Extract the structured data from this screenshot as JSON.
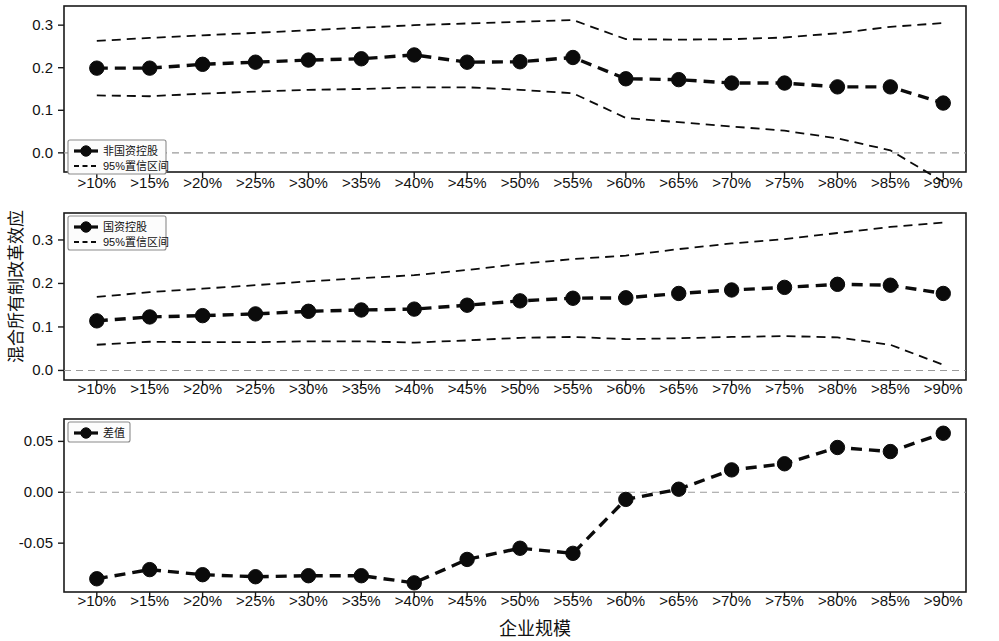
{
  "figure": {
    "ylabel": "混合所有制改革效应",
    "xlabel": "企业规模"
  },
  "chart_data": [
    {
      "type": "line",
      "panel_index": 1,
      "title": "",
      "xlabel": "",
      "ylabel": "混合所有制改革效应",
      "categories": [
        ">10%",
        ">15%",
        ">20%",
        ">25%",
        ">30%",
        ">35%",
        ">40%",
        ">45%",
        ">50%",
        ">55%",
        ">60%",
        ">65%",
        ">70%",
        ">75%",
        ">80%",
        ">85%",
        ">90%"
      ],
      "ytick_labels": [
        "0.0",
        "0.1",
        "0.2",
        "0.3"
      ],
      "ytick_values": [
        0.0,
        0.1,
        0.2,
        0.3
      ],
      "ylim": [
        -0.045,
        0.345
      ],
      "grid": false,
      "zero_reference_line": 0.0,
      "legend_position": "lower-left",
      "series": [
        {
          "name": "非国资控股",
          "style": "dashed-with-markers",
          "values": [
            0.199,
            0.199,
            0.208,
            0.213,
            0.218,
            0.221,
            0.23,
            0.213,
            0.214,
            0.224,
            0.174,
            0.172,
            0.164,
            0.164,
            0.155,
            0.155,
            0.117
          ]
        },
        {
          "name": "95%置信区间",
          "style": "dashed-upper",
          "values": [
            0.263,
            0.27,
            0.276,
            0.282,
            0.288,
            0.294,
            0.3,
            0.304,
            0.308,
            0.312,
            0.267,
            0.266,
            0.267,
            0.271,
            0.281,
            0.296,
            0.305
          ]
        },
        {
          "name": "95%置信区间",
          "style": "dashed-lower",
          "values": [
            0.135,
            0.133,
            0.139,
            0.144,
            0.148,
            0.15,
            0.154,
            0.154,
            0.148,
            0.14,
            0.082,
            0.072,
            0.062,
            0.052,
            0.034,
            0.006,
            -0.068
          ]
        }
      ]
    },
    {
      "type": "line",
      "panel_index": 2,
      "title": "",
      "xlabel": "",
      "ylabel": "混合所有制改革效应",
      "categories": [
        ">10%",
        ">15%",
        ">20%",
        ">25%",
        ">30%",
        ">35%",
        ">40%",
        ">45%",
        ">50%",
        ">55%",
        ">60%",
        ">65%",
        ">70%",
        ">75%",
        ">80%",
        ">85%",
        ">90%"
      ],
      "ytick_labels": [
        "0.0",
        "0.1",
        "0.2",
        "0.3"
      ],
      "ytick_values": [
        0.0,
        0.1,
        0.2,
        0.3
      ],
      "ylim": [
        -0.022,
        0.362
      ],
      "grid": false,
      "zero_reference_line": 0.0,
      "legend_position": "upper-left",
      "series": [
        {
          "name": "国资控股",
          "style": "dashed-with-markers",
          "values": [
            0.114,
            0.123,
            0.126,
            0.13,
            0.136,
            0.139,
            0.141,
            0.15,
            0.16,
            0.166,
            0.167,
            0.177,
            0.185,
            0.191,
            0.198,
            0.196,
            0.177
          ]
        },
        {
          "name": "95%置信区间",
          "style": "dashed-upper",
          "values": [
            0.169,
            0.18,
            0.188,
            0.196,
            0.205,
            0.212,
            0.219,
            0.231,
            0.245,
            0.256,
            0.264,
            0.279,
            0.292,
            0.302,
            0.316,
            0.33,
            0.34
          ]
        },
        {
          "name": "95%置信区间",
          "style": "dashed-lower",
          "values": [
            0.059,
            0.066,
            0.065,
            0.065,
            0.067,
            0.067,
            0.064,
            0.069,
            0.075,
            0.077,
            0.072,
            0.074,
            0.077,
            0.079,
            0.076,
            0.059,
            0.013
          ]
        }
      ]
    },
    {
      "type": "line",
      "panel_index": 3,
      "title": "",
      "xlabel": "企业规模",
      "ylabel": "混合所有制改革效应",
      "categories": [
        ">10%",
        ">15%",
        ">20%",
        ">25%",
        ">30%",
        ">35%",
        ">40%",
        ">45%",
        ">50%",
        ">55%",
        ">60%",
        ">65%",
        ">70%",
        ">75%",
        ">80%",
        ">85%",
        ">90%"
      ],
      "ytick_labels": [
        "0.05",
        "0.00",
        "-0.05"
      ],
      "ytick_values": [
        0.05,
        0.0,
        -0.05
      ],
      "ylim": [
        -0.098,
        0.072
      ],
      "grid": false,
      "zero_reference_line": 0.0,
      "legend_position": "upper-left",
      "series": [
        {
          "name": "差值",
          "style": "dashed-with-markers",
          "values": [
            -0.085,
            -0.076,
            -0.081,
            -0.083,
            -0.082,
            -0.082,
            -0.089,
            -0.066,
            -0.055,
            -0.06,
            -0.007,
            0.003,
            0.022,
            0.028,
            0.044,
            0.04,
            0.058
          ]
        }
      ]
    }
  ],
  "panels": [
    {
      "legend": {
        "entries": [
          {
            "label": "非国资控股",
            "marker": "filled-circle-dashed-line"
          },
          {
            "label": "95%置信区间",
            "marker": "dashed-line"
          }
        ]
      }
    },
    {
      "legend": {
        "entries": [
          {
            "label": "国资控股",
            "marker": "filled-circle-dashed-line"
          },
          {
            "label": "95%置信区间",
            "marker": "dashed-line"
          }
        ]
      }
    },
    {
      "legend": {
        "entries": [
          {
            "label": "差值",
            "marker": "filled-circle-dashed-line"
          }
        ]
      }
    }
  ],
  "colors": {
    "series": "#0b0b0b",
    "axis": "#1a1a1a",
    "zero_line": "#9a9a9a",
    "background": "#ffffff"
  }
}
